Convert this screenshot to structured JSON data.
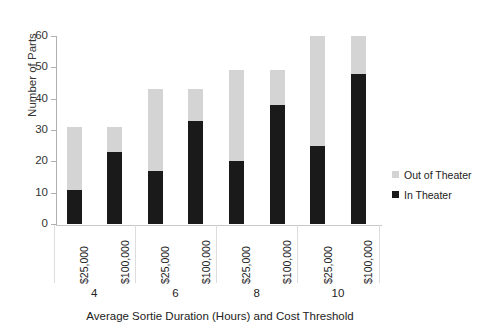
{
  "chart_data": {
    "type": "bar",
    "subtype": "stacked-bar",
    "title": "",
    "xlabel": "Average Sortie Duration (Hours) and Cost Threshold",
    "ylabel": "Number of Parts",
    "ylim": [
      0,
      60
    ],
    "ytick_labels": [
      "0",
      "10",
      "20",
      "30",
      "40",
      "50",
      "60"
    ],
    "yticks": [
      0,
      10,
      20,
      30,
      40,
      50,
      60
    ],
    "grid": false,
    "legend_position": "right",
    "categories": [
      "$25,000",
      "$100,000",
      "$25,000",
      "$100,000",
      "$25,000",
      "$100,000",
      "$25,000",
      "$100,000"
    ],
    "group_labels": [
      "4",
      "6",
      "8",
      "10"
    ],
    "group_label_title": "Average Sortie Duration (Hours)",
    "series": [
      {
        "name": "In Theater",
        "color": "#1a1a1a",
        "values": [
          11,
          23,
          17,
          33,
          20,
          38,
          25,
          48
        ]
      },
      {
        "name": "Out of Theater",
        "color": "#d4d4d4",
        "values": [
          20,
          8,
          26,
          10,
          29,
          11,
          35,
          12
        ]
      }
    ],
    "totals": [
      31,
      31,
      43,
      43,
      49,
      49,
      60,
      60
    ]
  },
  "legend": {
    "items": [
      {
        "label": "Out of Theater",
        "color": "#d4d4d4"
      },
      {
        "label": "In Theater",
        "color": "#1a1a1a"
      }
    ]
  }
}
